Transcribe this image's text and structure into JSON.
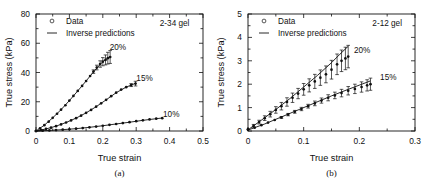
{
  "figure": {
    "panels": [
      {
        "caption": "(a)",
        "gel_label": "2-34 gel",
        "legend": [
          {
            "marker": "open-circle",
            "label": "Data"
          },
          {
            "marker": "line",
            "label": "Inverse predictions"
          }
        ],
        "chart_data": {
          "type": "scatter",
          "title": "",
          "xlabel": "True strain",
          "ylabel": "True stress (kPa)",
          "xlim": [
            0,
            0.5
          ],
          "ylim": [
            0,
            80
          ],
          "xticks": [
            0,
            0.1,
            0.2,
            0.3,
            0.4,
            0.5
          ],
          "xticklabels": [
            "0",
            "0.1",
            "0.2",
            "0.3",
            "0.4",
            "0.5"
          ],
          "yticks": [
            0,
            20,
            40,
            60,
            80
          ],
          "yticklabels": [
            "0",
            "20",
            "40",
            "60",
            "80"
          ],
          "grid": false,
          "legend_position": "top-left",
          "annotations": [
            {
              "text": "20%",
              "x": 0.245,
              "y": 57.5
            },
            {
              "text": "15%",
              "x": 0.325,
              "y": 36.0
            },
            {
              "text": "10%",
              "x": 0.405,
              "y": 11.5
            },
            {
              "text": "2-34 gel",
              "x": 0.415,
              "y": 74.0
            }
          ],
          "series": [
            {
              "name": "20%",
              "marker": "filled-circle",
              "x": [
                0.0,
                0.012,
                0.025,
                0.038,
                0.05,
                0.063,
                0.075,
                0.088,
                0.1,
                0.112,
                0.125,
                0.138,
                0.15,
                0.162,
                0.172,
                0.182,
                0.192,
                0.2,
                0.208,
                0.215,
                0.222
              ],
              "y": [
                0.0,
                1.8,
                4.0,
                6.4,
                9.0,
                11.8,
                14.6,
                17.6,
                20.8,
                24.0,
                27.4,
                30.8,
                34.2,
                37.6,
                40.6,
                43.4,
                45.8,
                47.4,
                48.6,
                49.8,
                50.6
              ],
              "yerr": [
                0.0,
                0.0,
                0.0,
                0.0,
                0.0,
                0.0,
                0.0,
                0.0,
                0.0,
                0.0,
                0.0,
                0.0,
                0.0,
                0.0,
                1.2,
                1.6,
                2.2,
                2.8,
                3.4,
                4.0,
                4.4
              ],
              "prediction": {
                "x": [
                  0.0,
                  0.025,
                  0.05,
                  0.075,
                  0.1,
                  0.125,
                  0.15,
                  0.175,
                  0.2,
                  0.222
                ],
                "y": [
                  0.0,
                  4.0,
                  9.0,
                  14.6,
                  20.8,
                  27.4,
                  34.2,
                  41.2,
                  47.4,
                  50.8
                ]
              }
            },
            {
              "name": "15%",
              "marker": "filled-circle",
              "x": [
                0.0,
                0.015,
                0.03,
                0.045,
                0.06,
                0.075,
                0.09,
                0.105,
                0.12,
                0.135,
                0.15,
                0.165,
                0.18,
                0.195,
                0.21,
                0.225,
                0.24,
                0.255,
                0.27,
                0.285,
                0.298
              ],
              "y": [
                0.0,
                0.6,
                1.4,
                2.3,
                3.3,
                4.5,
                5.8,
                7.2,
                8.8,
                10.5,
                12.4,
                14.4,
                16.6,
                18.9,
                21.3,
                23.8,
                26.2,
                28.3,
                30.0,
                31.4,
                32.4
              ],
              "yerr": [
                0.0,
                0.0,
                0.0,
                0.0,
                0.0,
                0.0,
                0.0,
                0.0,
                0.0,
                0.0,
                0.0,
                0.0,
                0.0,
                0.0,
                0.0,
                0.0,
                0.0,
                0.0,
                0.0,
                1.0,
                1.6
              ],
              "prediction": {
                "x": [
                  0.0,
                  0.03,
                  0.06,
                  0.09,
                  0.12,
                  0.15,
                  0.18,
                  0.21,
                  0.24,
                  0.27,
                  0.298
                ],
                "y": [
                  0.0,
                  1.4,
                  3.3,
                  5.8,
                  8.8,
                  12.4,
                  16.6,
                  21.3,
                  26.2,
                  30.0,
                  32.6
                ]
              }
            },
            {
              "name": "10%",
              "marker": "filled-circle",
              "x": [
                0.0,
                0.02,
                0.04,
                0.06,
                0.08,
                0.1,
                0.12,
                0.14,
                0.16,
                0.18,
                0.2,
                0.22,
                0.24,
                0.26,
                0.28,
                0.3,
                0.32,
                0.34,
                0.36,
                0.378
              ],
              "y": [
                0.0,
                0.2,
                0.4,
                0.6,
                0.9,
                1.2,
                1.6,
                2.0,
                2.5,
                3.0,
                3.6,
                4.2,
                4.8,
                5.4,
                6.0,
                6.7,
                7.3,
                7.9,
                8.4,
                8.8
              ],
              "yerr": [
                0.0,
                0.0,
                0.0,
                0.0,
                0.0,
                0.0,
                0.0,
                0.0,
                0.0,
                0.0,
                0.0,
                0.0,
                0.0,
                0.0,
                0.0,
                0.0,
                0.0,
                0.0,
                0.0,
                0.0
              ],
              "prediction": {
                "x": [
                  0.0,
                  0.04,
                  0.08,
                  0.12,
                  0.16,
                  0.2,
                  0.24,
                  0.28,
                  0.32,
                  0.378
                ],
                "y": [
                  0.0,
                  0.4,
                  0.9,
                  1.6,
                  2.5,
                  3.6,
                  4.8,
                  6.0,
                  7.3,
                  8.9
                ]
              }
            }
          ]
        }
      },
      {
        "caption": "(b)",
        "gel_label": "2-12 gel",
        "legend": [
          {
            "marker": "open-circle",
            "label": "Data"
          },
          {
            "marker": "line",
            "label": "Inverse predictions"
          }
        ],
        "chart_data": {
          "type": "scatter",
          "title": "",
          "xlabel": "True strain",
          "ylabel": "True stress (kPa)",
          "xlim": [
            0,
            0.3
          ],
          "ylim": [
            0,
            5
          ],
          "xticks": [
            0,
            0.1,
            0.2,
            0.3
          ],
          "xticklabels": [
            "0",
            "0.1",
            "0.2",
            "0.3"
          ],
          "yticks": [
            0,
            1,
            2,
            3,
            4,
            5
          ],
          "yticklabels": [
            "0",
            "1",
            "2",
            "3",
            "4",
            "5"
          ],
          "grid": false,
          "legend_position": "top-left",
          "annotations": [
            {
              "text": "20%",
              "x": 0.205,
              "y": 3.45
            },
            {
              "text": "15%",
              "x": 0.252,
              "y": 2.3
            },
            {
              "text": "2-12 gel",
              "x": 0.25,
              "y": 4.62
            }
          ],
          "series": [
            {
              "name": "20%",
              "marker": "filled-circle",
              "x": [
                0.0,
                0.01,
                0.02,
                0.03,
                0.04,
                0.05,
                0.06,
                0.07,
                0.08,
                0.09,
                0.1,
                0.11,
                0.12,
                0.13,
                0.14,
                0.15,
                0.16,
                0.168,
                0.175,
                0.18
              ],
              "y": [
                0.08,
                0.22,
                0.38,
                0.55,
                0.72,
                0.9,
                1.06,
                1.24,
                1.42,
                1.6,
                1.78,
                1.95,
                2.12,
                2.28,
                2.42,
                2.62,
                2.85,
                3.0,
                3.1,
                3.18
              ],
              "yerr": [
                0.0,
                0.06,
                0.08,
                0.1,
                0.12,
                0.14,
                0.16,
                0.18,
                0.2,
                0.22,
                0.25,
                0.28,
                0.3,
                0.33,
                0.36,
                0.4,
                0.44,
                0.46,
                0.48,
                0.48
              ],
              "prediction": {
                "x": [
                  0.0,
                  0.025,
                  0.05,
                  0.075,
                  0.1,
                  0.125,
                  0.15,
                  0.165,
                  0.18
                ],
                "y": [
                  0.05,
                  0.48,
                  0.92,
                  1.38,
                  1.88,
                  2.38,
                  2.92,
                  3.28,
                  3.62
                ]
              }
            },
            {
              "name": "15%",
              "marker": "filled-circle",
              "x": [
                0.0,
                0.012,
                0.024,
                0.036,
                0.048,
                0.06,
                0.072,
                0.084,
                0.096,
                0.108,
                0.12,
                0.132,
                0.144,
                0.156,
                0.168,
                0.18,
                0.192,
                0.204,
                0.214,
                0.22
              ],
              "y": [
                0.05,
                0.14,
                0.25,
                0.36,
                0.47,
                0.58,
                0.7,
                0.82,
                0.94,
                1.06,
                1.18,
                1.3,
                1.42,
                1.52,
                1.62,
                1.72,
                1.8,
                1.88,
                1.95,
                2.0
              ],
              "yerr": [
                0.0,
                0.0,
                0.0,
                0.0,
                0.0,
                0.04,
                0.05,
                0.06,
                0.07,
                0.08,
                0.1,
                0.11,
                0.13,
                0.14,
                0.16,
                0.18,
                0.2,
                0.22,
                0.24,
                0.26
              ],
              "prediction": {
                "x": [
                  0.0,
                  0.03,
                  0.06,
                  0.09,
                  0.12,
                  0.15,
                  0.18,
                  0.2,
                  0.22
                ],
                "y": [
                  0.04,
                  0.3,
                  0.6,
                  0.9,
                  1.2,
                  1.5,
                  1.78,
                  1.96,
                  2.14
                ]
              }
            }
          ]
        }
      }
    ]
  }
}
